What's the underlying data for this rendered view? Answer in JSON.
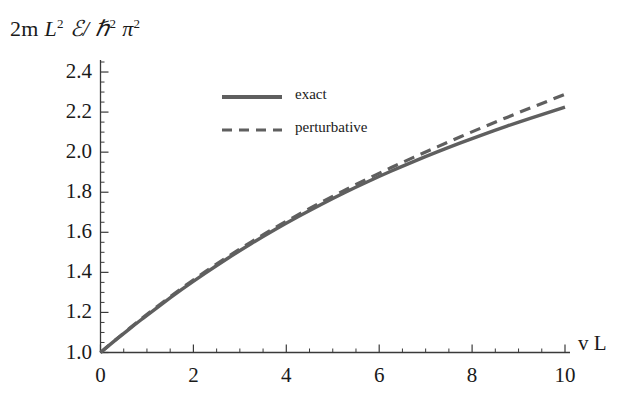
{
  "chart_data": {
    "type": "line",
    "title": "",
    "ylabel": "2m L² ℰ/ ℏ² π²",
    "ylabel_parts": {
      "prefix": "2m ",
      "L": "L",
      "L_exp": "2",
      "script_E": "ℰ/",
      "hbar": "ℏ",
      "hbar_exp": "2",
      "pi": "π",
      "pi_exp": "2"
    },
    "xlabel": "v L",
    "xlim": [
      0,
      10
    ],
    "ylim": [
      1.0,
      2.45
    ],
    "grid": false,
    "xticks": [
      0,
      2,
      4,
      6,
      8,
      10
    ],
    "xtick_labels": [
      "0",
      "2",
      "4",
      "6",
      "8",
      "10"
    ],
    "xminor_step": 0.5,
    "yticks": [
      1.0,
      1.2,
      1.4,
      1.6,
      1.8,
      2.0,
      2.2,
      2.4
    ],
    "ytick_labels": [
      "1.0",
      "1.2",
      "1.4",
      "1.6",
      "1.8",
      "2.0",
      "2.2",
      "2.4"
    ],
    "yminor_step": 0.05,
    "legend_position": "upper-center-left",
    "line_color": "#5f5f5f",
    "axis_color": "#3a3a3a",
    "text_color": "#1a1a1a",
    "x": [
      0,
      0.25,
      0.5,
      0.75,
      1,
      1.5,
      2,
      2.5,
      3,
      3.5,
      4,
      4.5,
      5,
      5.5,
      6,
      6.5,
      7,
      7.5,
      8,
      8.5,
      9,
      9.5,
      10
    ],
    "series": [
      {
        "name": "exact",
        "style": "solid",
        "values": [
          1.0,
          1.048,
          1.095,
          1.141,
          1.186,
          1.273,
          1.356,
          1.434,
          1.509,
          1.579,
          1.646,
          1.709,
          1.769,
          1.826,
          1.879,
          1.93,
          1.978,
          2.024,
          2.068,
          2.11,
          2.15,
          2.188,
          2.225
        ]
      },
      {
        "name": "perturbative",
        "style": "dashed",
        "values": [
          1.0,
          1.049,
          1.097,
          1.144,
          1.19,
          1.279,
          1.363,
          1.442,
          1.517,
          1.588,
          1.655,
          1.719,
          1.78,
          1.839,
          1.895,
          1.949,
          2.001,
          2.052,
          2.102,
          2.15,
          2.197,
          2.243,
          2.289
        ]
      }
    ],
    "legend": [
      {
        "label": "exact",
        "style": "solid"
      },
      {
        "label": "perturbative",
        "style": "dashed"
      }
    ]
  },
  "axes": {
    "origin_label": "0"
  }
}
